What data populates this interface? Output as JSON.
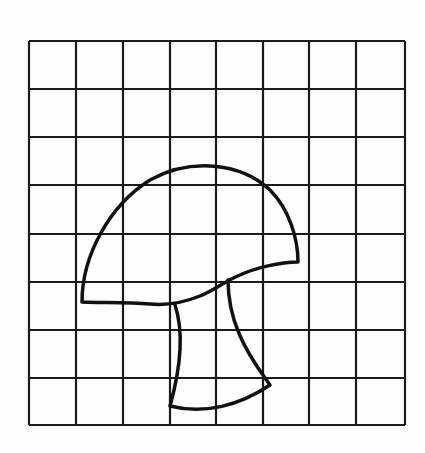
{
  "diagram": {
    "title": "",
    "grid": {
      "columns": 8,
      "rows": 8,
      "x_lines": [
        29,
        76,
        123,
        170,
        216,
        263,
        309,
        356,
        405
      ],
      "y_lines": [
        41,
        89,
        137,
        185,
        234,
        282,
        330,
        378,
        425
      ],
      "line_color": "#1a1a1a",
      "line_width": 2.2
    },
    "shapes": [
      {
        "name": "mushroom-cap",
        "stroke": "#111111",
        "stroke_width": 3.5,
        "path": "M 82 302 C 82 255, 110 205, 150 180 C 190 158, 240 162, 270 190 C 290 210, 298 240, 298 262 C 280 262, 255 268, 240 275 C 225 281, 215 290, 200 296 C 185 302, 170 306, 150 304 C 125 302, 100 303, 82 302 Z"
      },
      {
        "name": "mushroom-stem",
        "stroke": "#111111",
        "stroke_width": 3.5,
        "path": "M 175 305 C 185 335, 180 370, 170 406 C 205 415, 240 405, 270 385 L 265 378 C 245 350, 228 320, 228 280"
      }
    ]
  }
}
